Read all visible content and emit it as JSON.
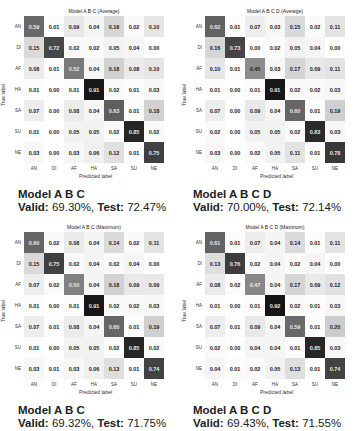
{
  "chart_data": [
    {
      "type": "heatmap",
      "title": "Model A B C (Average)",
      "xlabel": "Predicted label",
      "ylabel": "True label",
      "x": [
        "AN",
        "DI",
        "AF",
        "HA",
        "SA",
        "SU",
        "NE"
      ],
      "y": [
        "AN",
        "DI",
        "AF",
        "HA",
        "SA",
        "SU",
        "NE"
      ],
      "values": [
        [
          0.59,
          0.01,
          0.09,
          0.04,
          0.16,
          0.02,
          0.1
        ],
        [
          0.15,
          0.72,
          0.02,
          0.02,
          0.05,
          0.04,
          0.0
        ],
        [
          0.08,
          0.01,
          0.52,
          0.04,
          0.18,
          0.08,
          0.1
        ],
        [
          0.01,
          0.0,
          0.01,
          0.91,
          0.02,
          0.01,
          0.03
        ],
        [
          0.07,
          0.0,
          0.08,
          0.04,
          0.63,
          0.01,
          0.18
        ],
        [
          0.01,
          0.0,
          0.05,
          0.05,
          0.02,
          0.85,
          0.02
        ],
        [
          0.03,
          0.0,
          0.03,
          0.06,
          0.12,
          0.01,
          0.75
        ]
      ],
      "caption_model": "Model A B C",
      "valid": "69.30%",
      "test": "72.47%"
    },
    {
      "type": "heatmap",
      "title": "Model A B C D (Average)",
      "xlabel": "Predicted label",
      "ylabel": "True label",
      "x": [
        "AN",
        "DI",
        "AF",
        "HA",
        "SA",
        "SU",
        "NE"
      ],
      "y": [
        "AN",
        "DI",
        "AF",
        "HA",
        "SA",
        "SU",
        "NE"
      ],
      "values": [
        [
          0.62,
          0.01,
          0.07,
          0.03,
          0.15,
          0.02,
          0.11
        ],
        [
          0.16,
          0.73,
          0.0,
          0.02,
          0.05,
          0.04,
          0.0
        ],
        [
          0.1,
          0.01,
          0.45,
          0.03,
          0.17,
          0.09,
          0.11
        ],
        [
          0.01,
          0.0,
          0.01,
          0.91,
          0.02,
          0.02,
          0.03
        ],
        [
          0.07,
          0.0,
          0.09,
          0.04,
          0.6,
          0.01,
          0.19
        ],
        [
          0.02,
          0.0,
          0.05,
          0.05,
          0.02,
          0.83,
          0.03
        ],
        [
          0.03,
          0.0,
          0.02,
          0.05,
          0.11,
          0.01,
          0.78
        ]
      ],
      "caption_model": "Model A B C D",
      "valid": "70.00%",
      "test": "72.14%"
    },
    {
      "type": "heatmap",
      "title": "Model A B C (Maximum)",
      "xlabel": "Predicted label",
      "ylabel": "True label",
      "x": [
        "AN",
        "DI",
        "AF",
        "HA",
        "SA",
        "SU",
        "NE"
      ],
      "y": [
        "AN",
        "DI",
        "AF",
        "HA",
        "SA",
        "SU",
        "NE"
      ],
      "values": [
        [
          0.6,
          0.02,
          0.08,
          0.04,
          0.14,
          0.02,
          0.11
        ],
        [
          0.15,
          0.75,
          0.02,
          0.04,
          0.02,
          0.04,
          0.0
        ],
        [
          0.07,
          0.02,
          0.5,
          0.04,
          0.18,
          0.09,
          0.09
        ],
        [
          0.01,
          0.0,
          0.01,
          0.91,
          0.02,
          0.02,
          0.03
        ],
        [
          0.07,
          0.01,
          0.08,
          0.04,
          0.6,
          0.01,
          0.19
        ],
        [
          0.01,
          0.0,
          0.05,
          0.05,
          0.02,
          0.85,
          0.02
        ],
        [
          0.03,
          0.01,
          0.03,
          0.06,
          0.13,
          0.01,
          0.74
        ]
      ],
      "caption_model": "Model A B C",
      "valid": "69.32%",
      "test": "71.75%"
    },
    {
      "type": "heatmap",
      "title": "Model A B C D (Maximum)",
      "xlabel": "Predicted label",
      "ylabel": "True label",
      "x": [
        "AN",
        "DI",
        "AF",
        "HA",
        "SA",
        "SU",
        "NE"
      ],
      "y": [
        "AN",
        "DI",
        "AF",
        "HA",
        "SA",
        "SU",
        "NE"
      ],
      "values": [
        [
          0.61,
          0.01,
          0.07,
          0.04,
          0.14,
          0.01,
          0.11
        ],
        [
          0.13,
          0.76,
          0.02,
          0.04,
          0.02,
          0.04,
          0.0
        ],
        [
          0.08,
          0.02,
          0.47,
          0.04,
          0.17,
          0.09,
          0.12
        ],
        [
          0.01,
          0.0,
          0.01,
          0.92,
          0.02,
          0.01,
          0.03
        ],
        [
          0.07,
          0.01,
          0.09,
          0.04,
          0.59,
          0.01,
          0.2
        ],
        [
          0.02,
          0.0,
          0.04,
          0.04,
          0.01,
          0.85,
          0.03
        ],
        [
          0.04,
          0.01,
          0.02,
          0.05,
          0.13,
          0.01,
          0.74
        ]
      ],
      "caption_model": "Model A B C D",
      "valid": "69.43%",
      "test": "71.55%"
    }
  ],
  "labels": {
    "valid_prefix": "Valid:",
    "test_prefix": "Test:"
  }
}
